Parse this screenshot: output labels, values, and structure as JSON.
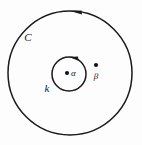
{
  "figure": {
    "background_color": "#fdfdfd",
    "stroke_color": "#1a1a1a",
    "width": 142,
    "height": 145
  },
  "contours": [
    {
      "id": "outer",
      "label": "C",
      "label_x": 28,
      "label_y": 41,
      "cx": 70,
      "cy": 73,
      "r": 62,
      "stroke_width": 1.5,
      "orientation": "counterclockwise",
      "arrow_position": "top"
    },
    {
      "id": "inner",
      "label": "k",
      "label_x": 47,
      "label_y": 92,
      "cx": 69,
      "cy": 74,
      "r": 17,
      "stroke_width": 1.5,
      "orientation": "counterclockwise",
      "arrow_position": "top"
    }
  ],
  "points": [
    {
      "id": "alpha",
      "label": "α",
      "dot_x": 67,
      "dot_y": 73,
      "dot_r": 2.1,
      "label_x": 71,
      "label_y": 76
    },
    {
      "id": "beta",
      "label": "β",
      "dot_x": 96,
      "dot_y": 65,
      "dot_r": 2.1,
      "label_x": 93,
      "label_y": 79
    }
  ]
}
